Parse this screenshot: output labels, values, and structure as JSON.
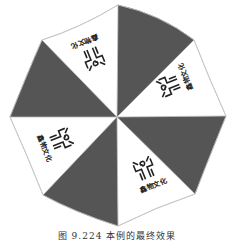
{
  "figure": {
    "caption": "图 9.224  本例的最终效果",
    "panel_count": 8,
    "colors": {
      "dark_panel": "#555555",
      "light_panel": "#ffffff",
      "outline": "#b0b0b0",
      "logo": "#222222"
    },
    "panels": [
      {
        "index": 0,
        "fill": "dark"
      },
      {
        "index": 1,
        "fill": "light",
        "has_logo": true
      },
      {
        "index": 2,
        "fill": "dark"
      },
      {
        "index": 3,
        "fill": "light",
        "has_logo": true
      },
      {
        "index": 4,
        "fill": "dark"
      },
      {
        "index": 5,
        "fill": "light",
        "has_logo": true
      },
      {
        "index": 6,
        "fill": "dark"
      },
      {
        "index": 7,
        "fill": "light",
        "has_logo": true
      }
    ],
    "logo": {
      "icon": "stylized-glyph-logo-icon",
      "text": "鑫物文化"
    }
  }
}
